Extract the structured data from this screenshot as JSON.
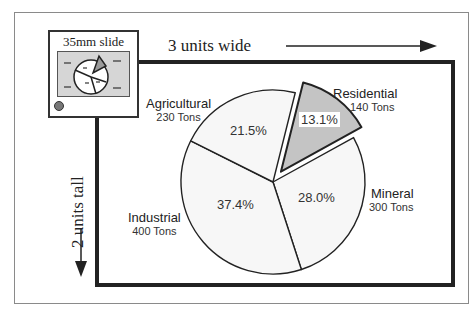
{
  "slide": {
    "label": "35mm slide"
  },
  "dimensions": {
    "width_label": "3 units wide",
    "height_label": "2 units tall"
  },
  "chart_data": {
    "type": "pie",
    "title": "",
    "unit": "Tons",
    "slices": [
      {
        "name": "Residential",
        "value": 140,
        "value_label": "140 Tons",
        "percent": 13.1,
        "percent_label": "13.1%",
        "exploded": true,
        "fill": "#c4c4c4"
      },
      {
        "name": "Mineral",
        "value": 300,
        "value_label": "300 Tons",
        "percent": 28.0,
        "percent_label": "28.0%",
        "exploded": false,
        "fill": "#f7f7f7"
      },
      {
        "name": "Industrial",
        "value": 400,
        "value_label": "400 Tons",
        "percent": 37.4,
        "percent_label": "37.4%",
        "exploded": false,
        "fill": "#f7f7f7"
      },
      {
        "name": "Agricultural",
        "value": 230,
        "value_label": "230 Tons",
        "percent": 21.5,
        "percent_label": "21.5%",
        "exploded": false,
        "fill": "#f7f7f7"
      }
    ]
  }
}
